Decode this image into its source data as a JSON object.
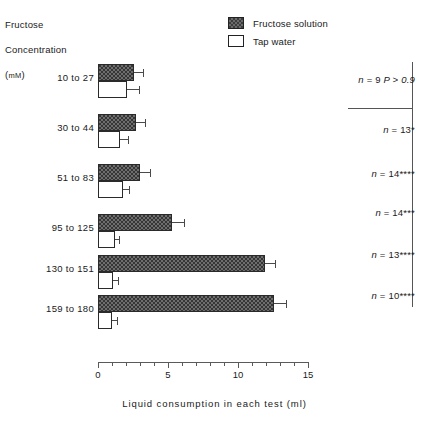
{
  "axis_titles": {
    "y_line1": "Fructose",
    "y_line2": "Concentration",
    "y_line3_prefix": "(",
    "y_line3_unit": "mM",
    "y_line3_suffix": ")",
    "x": "Liquid  consumption  in  each  test (ml)"
  },
  "legend": {
    "items": [
      {
        "key": "fructose-solution",
        "label": "Fructose solution",
        "swatch": "filled",
        "color": "#6e6e6e"
      },
      {
        "key": "tap-water",
        "label": "Tap water",
        "swatch": "open",
        "color": "#ffffff"
      }
    ]
  },
  "xaxis": {
    "min": 0,
    "max": 15,
    "major_ticks": [
      0,
      5,
      10,
      15
    ],
    "major_tick_labels": [
      "0",
      "5",
      "10",
      "15"
    ],
    "minor_ticks": [
      1,
      2,
      3,
      4,
      6,
      7,
      8,
      9,
      11,
      12,
      13,
      14
    ]
  },
  "stats": {
    "rows": [
      {
        "n_label": "n",
        "eq": " = ",
        "n_value": "9",
        "p_text": " P > 0.9",
        "stars": ""
      },
      {
        "n_label": "n",
        "eq": " = ",
        "n_value": "13",
        "p_text": "",
        "stars": "*"
      },
      {
        "n_label": "n",
        "eq": " = ",
        "n_value": "14",
        "p_text": "",
        "stars": "****"
      },
      {
        "n_label": "n",
        "eq": " = ",
        "n_value": "14",
        "p_text": "",
        "stars": "***"
      },
      {
        "n_label": "n",
        "eq": " = ",
        "n_value": "13",
        "p_text": "",
        "stars": "****"
      },
      {
        "n_label": "n",
        "eq": " = ",
        "n_value": "10",
        "p_text": "",
        "stars": "****"
      }
    ]
  },
  "chart_data": {
    "type": "bar",
    "orientation": "horizontal",
    "title": "",
    "xlabel": "Liquid  consumption  in  each  test (ml)",
    "ylabel": "Fructose Concentration (mM)",
    "xlim": [
      0,
      15
    ],
    "grid": false,
    "legend_position": "top-right",
    "categories": [
      "10 to 27",
      "30 to 44",
      "51 to 83",
      "95 to 125",
      "130 to 151",
      "159 to 180"
    ],
    "series": [
      {
        "name": "Fructose solution",
        "color": "#6e6e6e",
        "values": [
          2.6,
          2.7,
          3.0,
          5.3,
          11.9,
          12.6
        ],
        "errors": [
          0.7,
          0.7,
          0.8,
          0.9,
          0.8,
          0.9
        ]
      },
      {
        "name": "Tap water",
        "color": "#ffffff",
        "values": [
          2.1,
          1.6,
          1.8,
          1.2,
          1.1,
          1.0
        ],
        "errors": [
          0.9,
          0.6,
          0.5,
          0.4,
          0.4,
          0.4
        ]
      }
    ],
    "annotations": [
      "n = 9 P > 0.9",
      "n = 13*",
      "n = 14****",
      "n = 14***",
      "n = 13****",
      "n = 10****"
    ]
  }
}
